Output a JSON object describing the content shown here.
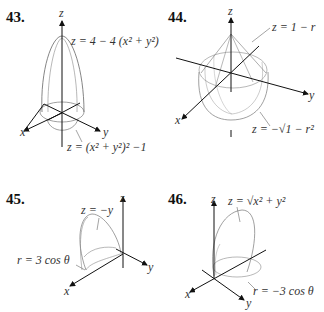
{
  "figures": [
    {
      "number": "43.",
      "axes": {
        "x": "x",
        "y": "y",
        "z": "z"
      },
      "labels": [
        "z = 4 − 4 (x² + y²)",
        "z = (x² + y²)² −1"
      ]
    },
    {
      "number": "44.",
      "axes": {
        "x": "x",
        "y": "y",
        "z": "z"
      },
      "labels": [
        "z = 1 − r",
        "z = −√1 − r²"
      ]
    },
    {
      "number": "45.",
      "axes": {
        "x": "x",
        "y": "y",
        "z": "z"
      },
      "labels": [
        "z = −y",
        "r = 3 cos θ"
      ]
    },
    {
      "number": "46.",
      "axes": {
        "x": "x",
        "y": "y",
        "z": "z"
      },
      "labels": [
        "z = √x² + y²",
        "r = −3 cos θ"
      ]
    }
  ]
}
